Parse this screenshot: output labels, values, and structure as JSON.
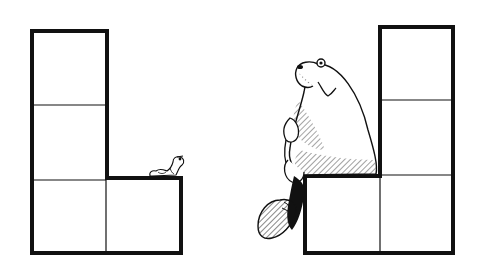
{
  "illustration": {
    "description": "Two L-shaped stacks of square blocks; a tiny worm sits on the left ledge, a large hunched creature sits on the right ledge",
    "colors": {
      "ink": "#111111",
      "paper": "#ffffff"
    },
    "left_structure": {
      "blocks": 4,
      "column_blocks": 3,
      "ledge_blocks": 1,
      "occupant": "worm"
    },
    "right_structure": {
      "blocks": 4,
      "column_blocks": 3,
      "ledge_blocks": 1,
      "occupant": "creature"
    }
  }
}
